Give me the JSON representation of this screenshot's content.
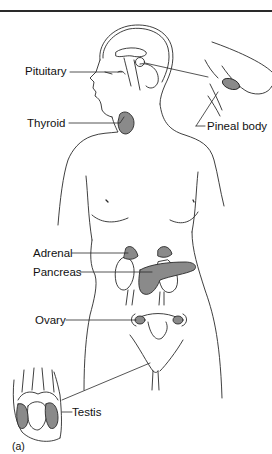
{
  "figure": {
    "caption": "(a)",
    "colors": {
      "line": "#2a2a2a",
      "gland_fill": "#8a8a8a",
      "background": "#ffffff"
    },
    "labels": {
      "pituitary": "Pituitary",
      "thyroid": "Thyroid",
      "pineal": "Pineal body",
      "adrenal": "Adrenal",
      "pancreas": "Pancreas",
      "ovary": "Ovary",
      "testis": "Testis"
    }
  }
}
